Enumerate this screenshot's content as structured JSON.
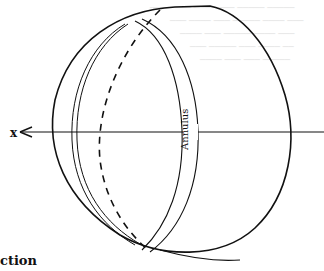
{
  "figure": {
    "axis_label": "x",
    "annulus_label": "Annulus",
    "caption_fragment": "ction",
    "stroke_color": "#111111",
    "background_color": "#ffffff",
    "bleed_through_color": "#e4e4e4"
  }
}
